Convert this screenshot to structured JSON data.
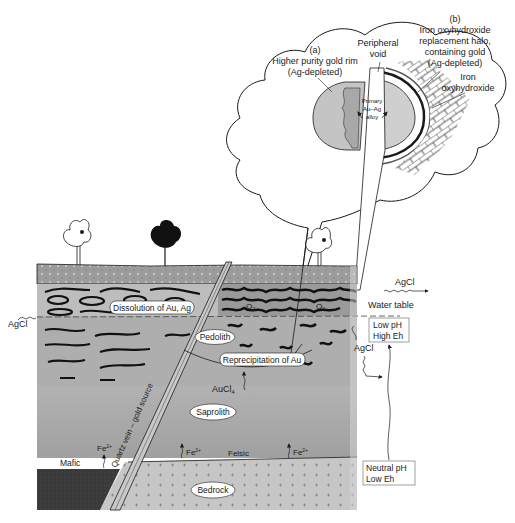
{
  "inset": {
    "label_a": "(a)",
    "text_a_line1": "Higher purity gold rim",
    "text_a_line2": "(Ag-depleted)",
    "peripheral_line1": "Peripheral",
    "peripheral_line2": "void",
    "label_b": "(b)",
    "text_b_line1": "Iron oxyhydroxide",
    "text_b_line2": "replacement halo,",
    "text_b_line3": "containing gold",
    "text_b_line4": "(Ag-depleted)",
    "iron_line1": "Iron",
    "iron_line2": "oxyhydroxide",
    "primary_line1": "Primary",
    "primary_line2": "Au–Ag",
    "primary_line3": "alloy"
  },
  "profile": {
    "dissolution": "Dissolution of Au, Ag",
    "o2_1": "O",
    "o2_2": "O",
    "o2_sub": "2",
    "pedolith": "Pedolith",
    "reprecipitation": "Reprecipitation of Au",
    "aucl4": "AuCl",
    "aucl4_sub": "4",
    "aucl4_sup": "−",
    "saprolith": "Saprolith",
    "bedrock": "Bedrock",
    "mafic": "Mafic",
    "felsic": "Felsic",
    "fe": "Fe",
    "fe_sup": "2+",
    "quartz_vein": "Quartz vein – gold source"
  },
  "side": {
    "agcl_top": "AgCl",
    "water_table": "Water table",
    "agcl_left": "AgCl",
    "agcl_right": "AgCl",
    "low_ph": "Low pH",
    "high_eh": "High Eh",
    "neutral_ph": "Neutral pH",
    "low_eh": "Low Eh"
  },
  "colors": {
    "topsoil": "#9a9a9a",
    "mottled": "#b8b8b8",
    "pedolith": "#a9a9a9",
    "saprolith": "#a4a4a4",
    "bedrock": "#c4c4c4",
    "mafic": "#3c3c3c",
    "ink": "#1a1a1a"
  }
}
